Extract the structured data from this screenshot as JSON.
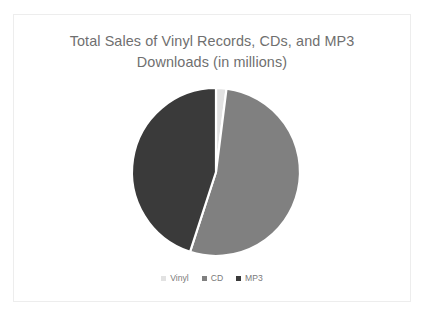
{
  "card": {
    "background": "#ffffff",
    "border_color": "#ededed"
  },
  "chart_data": {
    "type": "pie",
    "title": "Total Sales of Vinyl Records, CDs, and MP3\nDownloads (in millions)",
    "title_color": "#6f6f6f",
    "xlabel": "",
    "ylabel": "",
    "grid": false,
    "legend_position": "bottom",
    "labels": [
      "Vinyl",
      "CD",
      "MP3"
    ],
    "values": [
      2,
      53,
      45
    ],
    "units": "millions",
    "colors": [
      "#e2e2e2",
      "#808080",
      "#3a3a3a"
    ],
    "start_angle_deg": 0,
    "direction": "clockwise",
    "slices": [
      {
        "label": "Vinyl",
        "value": 2,
        "percent": 2,
        "color": "#e2e2e2",
        "start_deg": 0,
        "end_deg": 7.2
      },
      {
        "label": "CD",
        "value": 53,
        "percent": 53,
        "color": "#808080",
        "start_deg": 7.2,
        "end_deg": 198
      },
      {
        "label": "MP3",
        "value": 45,
        "percent": 45,
        "color": "#3a3a3a",
        "start_deg": 198,
        "end_deg": 360
      }
    ],
    "geometry": {
      "center_x": 202,
      "center_y": 157,
      "radius": 84,
      "separator_color": "#ffffff",
      "separator_width": 2.2
    }
  },
  "legend": {
    "items": [
      {
        "label": "Vinyl",
        "color": "#e2e2e2"
      },
      {
        "label": "CD",
        "color": "#808080"
      },
      {
        "label": "MP3",
        "color": "#3a3a3a"
      }
    ]
  }
}
